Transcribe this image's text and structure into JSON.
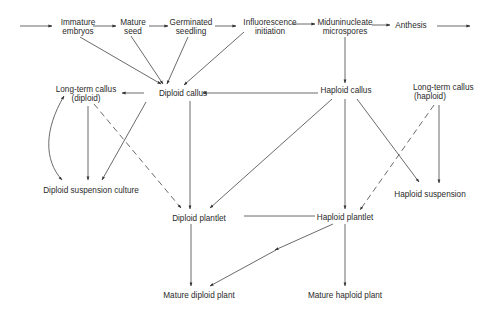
{
  "diagram": {
    "type": "flow",
    "nodes": {
      "immature_embryos": {
        "line1": "Immature",
        "line2": "embryos"
      },
      "mature_seed": {
        "line1": "Mature",
        "line2": "seed"
      },
      "germinated_seedling": {
        "line1": "Germinated",
        "line2": "seedling"
      },
      "influorescence_initiation": {
        "line1": "Influorescence",
        "line2": "initiation"
      },
      "miduninucleate_microspores": {
        "line1": "Miduninucleate",
        "line2": "microspores"
      },
      "anthesis": {
        "label": "Anthesis"
      },
      "long_term_callus_diploid": {
        "line1": "Long-term callus",
        "line2": "(diploid)"
      },
      "diploid_callus": {
        "label": "Diploid callus"
      },
      "haploid_callus": {
        "label": "Haploid callus"
      },
      "long_term_callus_haploid": {
        "line1": "Long-term callus",
        "line2": "(haploid)"
      },
      "diploid_suspension_culture": {
        "label": "Diploid suspension culture"
      },
      "haploid_suspension": {
        "label": "Haploid suspension"
      },
      "diploid_plantlet": {
        "label": "Diploid plantlet"
      },
      "haploid_plantlet": {
        "label": "Haploid plantlet"
      },
      "mature_diploid_plant": {
        "label": "Mature diploid plant"
      },
      "mature_haploid_plant": {
        "label": "Mature haploid plant"
      }
    },
    "edges": [
      {
        "from": "start",
        "to": "immature_embryos",
        "style": "solid"
      },
      {
        "from": "immature_embryos",
        "to": "mature_seed",
        "style": "solid"
      },
      {
        "from": "mature_seed",
        "to": "germinated_seedling",
        "style": "solid"
      },
      {
        "from": "germinated_seedling",
        "to": "influorescence_initiation",
        "style": "solid"
      },
      {
        "from": "influorescence_initiation",
        "to": "miduninucleate_microspores",
        "style": "solid"
      },
      {
        "from": "miduninucleate_microspores",
        "to": "anthesis",
        "style": "solid"
      },
      {
        "from": "anthesis",
        "to": "end",
        "style": "solid"
      },
      {
        "from": "immature_embryos",
        "to": "diploid_callus",
        "style": "solid"
      },
      {
        "from": "mature_seed",
        "to": "diploid_callus",
        "style": "solid"
      },
      {
        "from": "germinated_seedling",
        "to": "diploid_callus",
        "style": "solid"
      },
      {
        "from": "influorescence_initiation",
        "to": "diploid_callus",
        "style": "solid"
      },
      {
        "from": "miduninucleate_microspores",
        "to": "haploid_callus",
        "style": "solid"
      },
      {
        "from": "haploid_callus",
        "to": "diploid_callus",
        "style": "solid"
      },
      {
        "from": "diploid_callus",
        "to": "long_term_callus_diploid",
        "style": "solid"
      },
      {
        "from": "diploid_callus",
        "to": "diploid_suspension_culture",
        "style": "solid"
      },
      {
        "from": "diploid_callus",
        "to": "diploid_plantlet",
        "style": "solid"
      },
      {
        "from": "long_term_callus_diploid",
        "to": "diploid_suspension_culture",
        "style": "solid"
      },
      {
        "from": "diploid_suspension_culture",
        "to": "long_term_callus_diploid",
        "style": "curved-bidirectional"
      },
      {
        "from": "long_term_callus_diploid",
        "to": "diploid_plantlet",
        "style": "dashed"
      },
      {
        "from": "haploid_callus",
        "to": "diploid_plantlet",
        "style": "solid"
      },
      {
        "from": "haploid_callus",
        "to": "haploid_plantlet",
        "style": "solid"
      },
      {
        "from": "haploid_callus",
        "to": "haploid_suspension",
        "style": "solid"
      },
      {
        "from": "long_term_callus_haploid",
        "to": "haploid_suspension",
        "style": "solid"
      },
      {
        "from": "long_term_callus_haploid",
        "to": "haploid_plantlet",
        "style": "dashed"
      },
      {
        "from": "haploid_plantlet",
        "to": "diploid_plantlet",
        "style": "solid-line"
      },
      {
        "from": "diploid_plantlet",
        "to": "mature_diploid_plant",
        "style": "solid"
      },
      {
        "from": "haploid_plantlet",
        "to": "mature_diploid_plant",
        "style": "solid"
      },
      {
        "from": "haploid_plantlet",
        "to": "mature_haploid_plant",
        "style": "solid"
      }
    ]
  }
}
